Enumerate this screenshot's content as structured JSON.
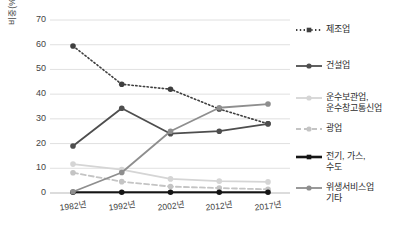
{
  "title": "",
  "axes": {
    "ylabel": "비중(%)",
    "yticks": [
      "70",
      "60",
      "50",
      "40",
      "30",
      "20",
      "10",
      "0"
    ],
    "xticks": [
      "1982년",
      "1992년",
      "2002년",
      "2012년",
      "2017년"
    ]
  },
  "legend": [
    {
      "label": "제조업",
      "style": "dotted",
      "color": "#3f3f3f",
      "marker": "square"
    },
    {
      "label": "건설업",
      "style": "solid",
      "color": "#4e4e4e",
      "marker": "circle"
    },
    {
      "label": "운수보관업,\n운수창고통신업",
      "style": "solid",
      "color": "#d5d5d5",
      "marker": "circle"
    },
    {
      "label": "광업",
      "style": "dashed",
      "color": "#c4c4c4",
      "marker": "circle"
    },
    {
      "label": "전기, 가스,\n수도",
      "style": "solid",
      "color": "#151515",
      "marker": "square"
    },
    {
      "label": "위생서비스업\n기타",
      "style": "solid",
      "color": "#8e8e8e",
      "marker": "circle"
    }
  ],
  "chart_data": {
    "type": "line",
    "title": "",
    "xlabel": "",
    "ylabel": "비중(%)",
    "ylim": [
      0,
      70
    ],
    "grid": true,
    "legend_position": "right",
    "categories": [
      "1982년",
      "1992년",
      "2002년",
      "2012년",
      "2017년"
    ],
    "series": [
      {
        "name": "제조업",
        "values": [
          59.5,
          44.0,
          42.0,
          34.0,
          28.0
        ],
        "color": "#3f3f3f",
        "style": "dotted",
        "marker": "circle"
      },
      {
        "name": "건설업",
        "values": [
          19.0,
          34.3,
          24.0,
          25.0,
          28.0
        ],
        "color": "#4e4e4e",
        "style": "solid",
        "marker": "circle"
      },
      {
        "name": "운수보관업, 운수창고통신업",
        "values": [
          11.7,
          9.5,
          5.7,
          4.8,
          4.5
        ],
        "color": "#d5d5d5",
        "style": "solid",
        "marker": "circle"
      },
      {
        "name": "광업",
        "values": [
          8.2,
          4.6,
          2.6,
          2.0,
          1.5
        ],
        "color": "#c4c4c4",
        "style": "dashed",
        "marker": "circle"
      },
      {
        "name": "전기, 가스, 수도",
        "values": [
          0.3,
          0.3,
          0.3,
          0.3,
          0.3
        ],
        "color": "#151515",
        "style": "solid",
        "marker": "circle"
      },
      {
        "name": "위생서비스업 기타",
        "values": [
          0.5,
          8.3,
          25.0,
          34.5,
          36.0
        ],
        "color": "#8e8e8e",
        "style": "solid",
        "marker": "circle"
      }
    ]
  }
}
